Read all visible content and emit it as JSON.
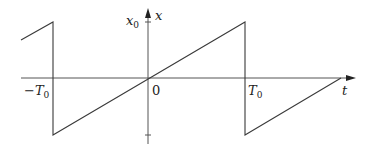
{
  "diagram": {
    "type": "sawtooth-waveform",
    "axes": {
      "horizontal_label": "t",
      "vertical_label": "x"
    },
    "labels": {
      "amplitude": "x",
      "amplitude_sub": "0",
      "neg_period": "−T",
      "neg_period_sub": "0",
      "origin": "0",
      "pos_period": "T",
      "pos_period_sub": "0"
    },
    "waveform": {
      "description": "Sawtooth: linear ramp from -x0 to x0 over each period, passing through origin, with vertical drops at ±T0",
      "points": [
        [
          21,
          40
        ],
        [
          53,
          22
        ],
        [
          53,
          135
        ],
        [
          245,
          22
        ],
        [
          245,
          135
        ],
        [
          341,
          78
        ]
      ]
    },
    "colors": {
      "line": "#3a3a3a",
      "axis": "#555555",
      "text": "#222222"
    }
  }
}
